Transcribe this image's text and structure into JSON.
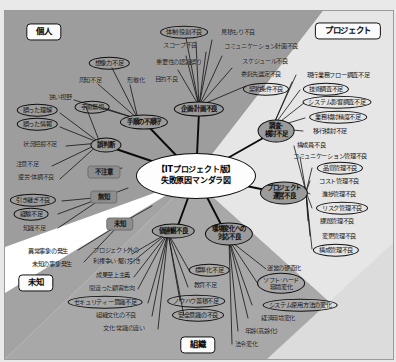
{
  "diagram": {
    "title": "【ITプロジェクト版】",
    "subtitle": "失敗原因マンダラ図",
    "colors": {
      "page_bg": "#efefef",
      "wedge_dark": "#9d9d9d",
      "wedge_light": "#ffffff",
      "hub_fill": "#9b9b9b",
      "chip_fill": "#8d8d8d",
      "ink": "#101010"
    }
  },
  "corners": [
    {
      "label": "個人",
      "x": 44,
      "y": 32
    },
    {
      "label": "プロジェクト",
      "x": 348,
      "y": 31
    },
    {
      "label": "未知",
      "x": 36,
      "y": 283
    },
    {
      "label": "組織",
      "x": 198,
      "y": 345
    }
  ],
  "center": {
    "x": 196,
    "y": 176
  },
  "chips": [
    {
      "label": "不注意",
      "x": 104,
      "y": 172
    },
    {
      "label": "無知",
      "x": 104,
      "y": 197
    },
    {
      "label": "未知",
      "x": 120,
      "y": 224
    }
  ],
  "hubs": [
    {
      "id": "plan",
      "label": "企画·計画不良",
      "x": 199,
      "y": 109,
      "w": 56
    },
    {
      "id": "procedure",
      "label": "手順の不順守",
      "x": 144,
      "y": 122,
      "w": 50
    },
    {
      "id": "misjudge",
      "label": "誤判断",
      "x": 106,
      "y": 145,
      "w": 34
    },
    {
      "id": "survey",
      "label": "調査·\n検討不足",
      "x": 276,
      "y": 131,
      "w": 42,
      "lines": [
        "調査·",
        "検討不足"
      ]
    },
    {
      "id": "pmgmt",
      "label": "プロジェクト\n運営不良",
      "x": 284,
      "y": 193,
      "w": 50,
      "lines": [
        "プロジェクト",
        "運営不良"
      ]
    },
    {
      "id": "values",
      "label": "価値観不良",
      "x": 173,
      "y": 231,
      "w": 46
    },
    {
      "id": "envchange",
      "label": "環境変化への\n対応不良",
      "x": 229,
      "y": 234,
      "w": 52,
      "lines": [
        "環境変化への",
        "対応不良"
      ]
    }
  ],
  "nodes": [
    {
      "label": "体制·役割不良",
      "x": 184,
      "y": 32,
      "style": "ell"
    },
    {
      "label": "見積もり不良",
      "x": 238,
      "y": 32,
      "style": "leaf"
    },
    {
      "label": "スコープ不良",
      "x": 180,
      "y": 45,
      "style": "leaf"
    },
    {
      "label": "コミュニケーション計画不良",
      "x": 261,
      "y": 46,
      "style": "leaf"
    },
    {
      "label": "重要性の認識誤り",
      "x": 179,
      "y": 62,
      "style": "leaf"
    },
    {
      "label": "スケジュール不良",
      "x": 265,
      "y": 61,
      "style": "leaf"
    },
    {
      "label": "委託先選定不良",
      "x": 261,
      "y": 74,
      "style": "leaf"
    },
    {
      "label": "現行業務フロー調査不足",
      "x": 338,
      "y": 75,
      "style": "leaf"
    },
    {
      "label": "目的不良",
      "x": 166,
      "y": 79,
      "style": "leaf"
    },
    {
      "label": "契約条件不良",
      "x": 266,
      "y": 89,
      "style": "ell"
    },
    {
      "label": "技術調査不足",
      "x": 326,
      "y": 89,
      "style": "ell"
    },
    {
      "label": "システム影響調査不足",
      "x": 337,
      "y": 102,
      "style": "ell"
    },
    {
      "label": "業務検討精度不足",
      "x": 338,
      "y": 117,
      "style": "ell"
    },
    {
      "label": "移行検討不足",
      "x": 330,
      "y": 131,
      "style": "leaf"
    },
    {
      "label": "構成員不良",
      "x": 311,
      "y": 145,
      "style": "leaf"
    },
    {
      "label": "コミュニケーション管理不良",
      "x": 330,
      "y": 156,
      "style": "leaf"
    },
    {
      "label": "品質管理不良",
      "x": 340,
      "y": 168,
      "style": "ell"
    },
    {
      "label": "コスト管理不良",
      "x": 339,
      "y": 181,
      "style": "leaf"
    },
    {
      "label": "進捗管理不良",
      "x": 339,
      "y": 194,
      "style": "leaf"
    },
    {
      "label": "リスク管理不良",
      "x": 342,
      "y": 208,
      "style": "ell"
    },
    {
      "label": "課題管理不良",
      "x": 337,
      "y": 221,
      "style": "leaf"
    },
    {
      "label": "変更管理不良",
      "x": 339,
      "y": 236,
      "style": "leaf"
    },
    {
      "label": "構成管理不良",
      "x": 336,
      "y": 250,
      "style": "ell"
    },
    {
      "label": "想像力不足",
      "x": 109,
      "y": 63,
      "style": "ell"
    },
    {
      "label": "周知不足",
      "x": 90,
      "y": 80,
      "style": "leaf"
    },
    {
      "label": "形骸化",
      "x": 136,
      "y": 80,
      "style": "leaf"
    },
    {
      "label": "狭い視野",
      "x": 60,
      "y": 97,
      "style": "leaf"
    },
    {
      "label": "手順無視",
      "x": 92,
      "y": 107,
      "style": "ell"
    },
    {
      "label": "誤った理解",
      "x": 37,
      "y": 110,
      "style": "ell"
    },
    {
      "label": "誤った情報",
      "x": 37,
      "y": 124,
      "style": "ell"
    },
    {
      "label": "状況把握不足",
      "x": 40,
      "y": 144,
      "style": "leaf"
    },
    {
      "label": "注意不足",
      "x": 27,
      "y": 164,
      "style": "leaf"
    },
    {
      "label": "疲労·体調不良",
      "x": 36,
      "y": 177,
      "style": "leaf"
    },
    {
      "label": "引き継ぎ不良",
      "x": 33,
      "y": 200,
      "style": "ell"
    },
    {
      "label": "経験不足",
      "x": 31,
      "y": 214,
      "style": "ell"
    },
    {
      "label": "知識不足",
      "x": 34,
      "y": 228,
      "style": "leaf"
    },
    {
      "label": "異常事象の発生",
      "x": 48,
      "y": 251,
      "style": "leaf"
    },
    {
      "label": "未知の事象発生",
      "x": 52,
      "y": 264,
      "style": "leaf"
    },
    {
      "label": "プロジェクト外の",
      "x": 116,
      "y": 250,
      "style": "leaf"
    },
    {
      "label": "利権争い·駆け引き",
      "x": 117,
      "y": 261,
      "style": "leaf"
    },
    {
      "label": "成果至上主義",
      "x": 113,
      "y": 275,
      "style": "leaf"
    },
    {
      "label": "間違った顧客志向",
      "x": 112,
      "y": 288,
      "style": "leaf"
    },
    {
      "label": "セキュリティー意識不足",
      "x": 105,
      "y": 302,
      "style": "ell"
    },
    {
      "label": "組織文化の不良",
      "x": 116,
      "y": 315,
      "style": "leaf"
    },
    {
      "label": "文化·常識の違い",
      "x": 124,
      "y": 328,
      "style": "leaf"
    },
    {
      "label": "標準化不足",
      "x": 209,
      "y": 270,
      "style": "ell"
    },
    {
      "label": "教育不足",
      "x": 205,
      "y": 285,
      "style": "leaf"
    },
    {
      "label": "ノウハウ蓄積不足",
      "x": 196,
      "y": 301,
      "style": "ell"
    },
    {
      "label": "安全意識の不良",
      "x": 198,
      "y": 315,
      "style": "ell"
    },
    {
      "label": "運営の硬直化",
      "x": 284,
      "y": 268,
      "style": "leaf"
    },
    {
      "label": "ソフト·ハード",
      "x": 281,
      "y": 283,
      "style": "ell2",
      "lines": [
        "ソフト·ハード",
        "環境変化"
      ]
    },
    {
      "label": "システム使用方法の変化",
      "x": 300,
      "y": 305,
      "style": "ell"
    },
    {
      "label": "経済環境変化",
      "x": 278,
      "y": 318,
      "style": "leaf"
    },
    {
      "label": "年齢(高齢化)",
      "x": 261,
      "y": 331,
      "style": "leaf"
    },
    {
      "label": "法令変化",
      "x": 246,
      "y": 344,
      "style": "leaf"
    }
  ],
  "links": {
    "from_center": [
      [
        196,
        176,
        199,
        112
      ],
      [
        196,
        176,
        146,
        124
      ],
      [
        196,
        176,
        110,
        147
      ],
      [
        196,
        176,
        272,
        133
      ],
      [
        196,
        176,
        281,
        193
      ],
      [
        196,
        176,
        176,
        231
      ],
      [
        196,
        176,
        226,
        234
      ]
    ],
    "from_plan": [
      [
        199,
        106,
        186,
        38
      ],
      [
        199,
        106,
        196,
        42
      ],
      [
        199,
        106,
        212,
        40
      ],
      [
        199,
        106,
        206,
        52
      ],
      [
        199,
        106,
        222,
        56
      ],
      [
        199,
        106,
        232,
        68
      ],
      [
        199,
        106,
        186,
        56
      ],
      [
        199,
        106,
        178,
        70
      ],
      [
        199,
        106,
        246,
        86
      ]
    ],
    "from_survey": [
      [
        272,
        128,
        300,
        90
      ],
      [
        272,
        128,
        304,
        103
      ],
      [
        272,
        128,
        305,
        118
      ],
      [
        272,
        128,
        303,
        131
      ],
      [
        272,
        128,
        292,
        82
      ],
      [
        272,
        128,
        296,
        75
      ]
    ],
    "from_pmgmt": [
      [
        306,
        192,
        294,
        146
      ],
      [
        306,
        192,
        300,
        157
      ],
      [
        306,
        192,
        312,
        168
      ],
      [
        306,
        192,
        310,
        181
      ],
      [
        306,
        192,
        310,
        194
      ],
      [
        306,
        192,
        312,
        208
      ],
      [
        306,
        192,
        308,
        221
      ],
      [
        306,
        192,
        310,
        236
      ],
      [
        306,
        192,
        312,
        249
      ]
    ],
    "from_procedure": [
      [
        138,
        119,
        112,
        68
      ],
      [
        138,
        119,
        98,
        84
      ],
      [
        138,
        119,
        130,
        85
      ],
      [
        138,
        119,
        104,
        108
      ],
      [
        138,
        119,
        74,
        100
      ]
    ],
    "from_misjudge": [
      [
        100,
        143,
        60,
        113
      ],
      [
        100,
        143,
        60,
        127
      ],
      [
        100,
        143,
        66,
        146
      ],
      [
        100,
        143,
        52,
        166
      ],
      [
        100,
        143,
        60,
        179
      ],
      [
        100,
        143,
        86,
        107
      ]
    ],
    "from_values": [
      [
        168,
        233,
        132,
        254
      ],
      [
        168,
        233,
        130,
        264
      ],
      [
        168,
        233,
        134,
        277
      ],
      [
        168,
        233,
        138,
        289
      ],
      [
        168,
        233,
        148,
        303
      ],
      [
        168,
        233,
        152,
        316
      ],
      [
        168,
        233,
        158,
        329
      ],
      [
        168,
        233,
        190,
        272
      ],
      [
        168,
        233,
        188,
        287
      ],
      [
        168,
        233,
        180,
        301
      ],
      [
        168,
        233,
        184,
        316
      ]
    ],
    "from_env": [
      [
        229,
        240,
        266,
        269
      ],
      [
        229,
        240,
        258,
        284
      ],
      [
        229,
        240,
        252,
        305
      ],
      [
        229,
        240,
        248,
        318
      ],
      [
        229,
        240,
        238,
        331
      ],
      [
        229,
        240,
        232,
        344
      ]
    ],
    "from_chips": [
      [
        104,
        172,
        122,
        168
      ],
      [
        104,
        197,
        128,
        188
      ],
      [
        120,
        224,
        152,
        206
      ],
      [
        104,
        197,
        62,
        201
      ],
      [
        104,
        197,
        58,
        214
      ],
      [
        104,
        197,
        58,
        228
      ],
      [
        120,
        224,
        78,
        250
      ],
      [
        120,
        224,
        84,
        262
      ]
    ]
  }
}
